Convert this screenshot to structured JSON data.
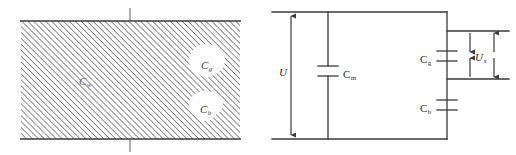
{
  "figure": {
    "width": 516,
    "height": 155,
    "background": "#ffffff",
    "line_color": "#3a3a3a",
    "hatch_color": "#6e6e6e",
    "text_color": "#2b2b2b"
  },
  "left_diagram": {
    "name": "hatched-dielectric-block",
    "labels": {
      "c_w": {
        "base": "C",
        "sub": "w"
      },
      "c_g": {
        "base": "C",
        "sub": "g"
      },
      "c_b": {
        "base": "C",
        "sub": "b"
      }
    },
    "hatch": {
      "angle_deg": 45,
      "direction": "lower-left-to-upper-right",
      "spacing_px": 4
    },
    "ticks": {
      "top_label": "",
      "bottom_label": ""
    }
  },
  "right_diagram": {
    "name": "equivalent-capacitance-circuit",
    "labels": {
      "u": {
        "base": "U",
        "sub": ""
      },
      "c_m": {
        "base": "C",
        "sub": "m"
      },
      "c_g": {
        "base": "C",
        "sub": "g"
      },
      "c_b": {
        "base": "C",
        "sub": "b"
      },
      "u_x": {
        "base": "U",
        "sub": "x"
      }
    },
    "components": [
      {
        "id": "c_m",
        "type": "capacitor",
        "orientation": "vertical"
      },
      {
        "id": "c_g",
        "type": "capacitor",
        "orientation": "vertical"
      },
      {
        "id": "c_b",
        "type": "capacitor",
        "orientation": "vertical"
      }
    ],
    "dimension_arrows": [
      {
        "id": "u",
        "style": "double-headed",
        "orientation": "vertical"
      },
      {
        "id": "u_x",
        "style": "double-headed-pair",
        "orientation": "vertical"
      }
    ]
  }
}
